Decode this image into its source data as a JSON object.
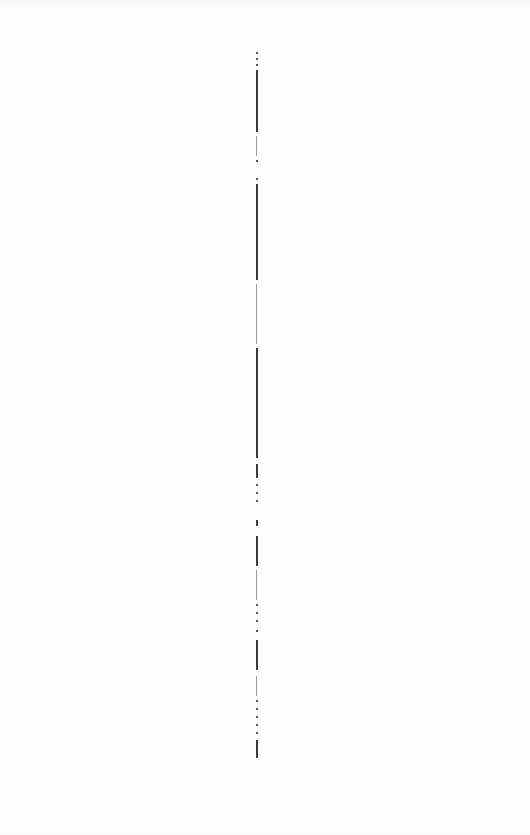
{
  "page": {
    "background": "#fefefe"
  },
  "divider": {
    "color": "#3a3a3a",
    "x": 257,
    "y_start": 50,
    "y_end": 760,
    "segments": [
      {
        "top": 52,
        "height": 2,
        "type": "dot"
      },
      {
        "top": 58,
        "height": 2,
        "type": "dot"
      },
      {
        "top": 64,
        "height": 2,
        "type": "dot"
      },
      {
        "top": 70,
        "height": 62,
        "type": "solid"
      },
      {
        "top": 136,
        "height": 20,
        "type": "faint"
      },
      {
        "top": 160,
        "height": 2,
        "type": "dot"
      },
      {
        "top": 178,
        "height": 2,
        "type": "dot"
      },
      {
        "top": 184,
        "height": 96,
        "type": "solid"
      },
      {
        "top": 284,
        "height": 60,
        "type": "faint"
      },
      {
        "top": 348,
        "height": 110,
        "type": "solid"
      },
      {
        "top": 464,
        "height": 14,
        "type": "solid"
      },
      {
        "top": 484,
        "height": 2,
        "type": "dot"
      },
      {
        "top": 492,
        "height": 2,
        "type": "dot"
      },
      {
        "top": 500,
        "height": 2,
        "type": "dot"
      },
      {
        "top": 520,
        "height": 6,
        "type": "solid"
      },
      {
        "top": 536,
        "height": 30,
        "type": "solid"
      },
      {
        "top": 570,
        "height": 30,
        "type": "faint"
      },
      {
        "top": 604,
        "height": 2,
        "type": "dot"
      },
      {
        "top": 612,
        "height": 2,
        "type": "dot"
      },
      {
        "top": 620,
        "height": 2,
        "type": "dot"
      },
      {
        "top": 630,
        "height": 2,
        "type": "dot"
      },
      {
        "top": 640,
        "height": 30,
        "type": "solid"
      },
      {
        "top": 676,
        "height": 20,
        "type": "faint"
      },
      {
        "top": 700,
        "height": 2,
        "type": "dot"
      },
      {
        "top": 708,
        "height": 2,
        "type": "dot"
      },
      {
        "top": 716,
        "height": 2,
        "type": "dot"
      },
      {
        "top": 724,
        "height": 2,
        "type": "dot"
      },
      {
        "top": 732,
        "height": 2,
        "type": "dot"
      },
      {
        "top": 740,
        "height": 18,
        "type": "solid"
      }
    ]
  }
}
